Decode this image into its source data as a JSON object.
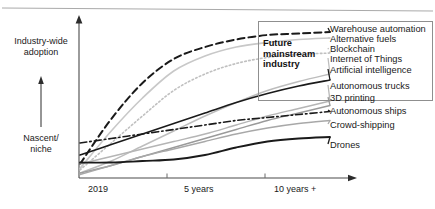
{
  "chart_data": {
    "type": "line",
    "title": "",
    "xlabel": "",
    "ylabel": "Industry-wide adoption / Nascent niche",
    "grid": false,
    "legend_position": "right",
    "x_tick_labels": [
      "2019",
      "5 years",
      "10 years +"
    ],
    "y_axis_low_label": "Nascent/\nniche",
    "y_axis_high_label": "Industry-wide\nadoption",
    "annotation": "Future\nmainstream\nindustry",
    "x": [
      0,
      0.5,
      1,
      1.5,
      2,
      2.5,
      3,
      3.5,
      4
    ],
    "xlim": [
      0,
      4
    ],
    "ylim": [
      0,
      100
    ],
    "series": [
      {
        "name": "Warehouse automation",
        "style": "dashed",
        "color": "#1a1a1a",
        "width": 2,
        "values": [
          8,
          38,
          62,
          78,
          86,
          91,
          94,
          95,
          96
        ]
      },
      {
        "name": "Alternative fuels",
        "style": "solid",
        "color": "#c8c8c8",
        "width": 1.6,
        "values": [
          5,
          30,
          52,
          70,
          80,
          86,
          89,
          91,
          92
        ]
      },
      {
        "name": "Blockchain",
        "style": "dotted",
        "color": "#c0c0c0",
        "width": 1.6,
        "values": [
          4,
          22,
          40,
          57,
          68,
          75,
          79,
          81,
          82
        ]
      },
      {
        "name": "Internet of Things",
        "style": "solid",
        "color": "#bdbdbd",
        "width": 1.4,
        "values": [
          2,
          10,
          20,
          30,
          40,
          49,
          57,
          63,
          68
        ]
      },
      {
        "name": "Artificial intelligence",
        "style": "solid",
        "color": "#1a1a1a",
        "width": 1.6,
        "values": [
          14,
          21,
          28,
          35,
          42,
          49,
          55,
          60,
          64
        ]
      },
      {
        "name": "Autonomous trucks",
        "style": "solid",
        "color": "#b5b5b5",
        "width": 1.4,
        "values": [
          8,
          13,
          18,
          23,
          28,
          34,
          40,
          45,
          50
        ]
      },
      {
        "name": "3D printing",
        "style": "solid",
        "color": "#9a9a9a",
        "width": 1.4,
        "values": [
          2,
          7,
          13,
          19,
          25,
          31,
          37,
          42,
          47
        ]
      },
      {
        "name": "Autonomous ships",
        "style": "dashdot",
        "color": "#1a1a1a",
        "width": 1.6,
        "values": [
          22,
          25,
          28,
          31,
          34,
          37,
          39,
          41,
          43
        ]
      },
      {
        "name": "Crowd-shipping",
        "style": "solid",
        "color": "#a8a8a8",
        "width": 1.4,
        "values": [
          1,
          7,
          13,
          18,
          23,
          28,
          32,
          35,
          37
        ]
      },
      {
        "name": "Drones",
        "style": "solid",
        "color": "#1a1a1a",
        "width": 1.8,
        "values": [
          9,
          9,
          10,
          11,
          14,
          19,
          23,
          25,
          26
        ]
      }
    ]
  },
  "legend": {
    "items": [
      {
        "label": "Warehouse automation"
      },
      {
        "label": "Alternative fuels"
      },
      {
        "label": "Blockchain"
      },
      {
        "label": "Internet of Things"
      },
      {
        "label": "Artificial intelligence"
      },
      {
        "label": "Autonomous trucks"
      },
      {
        "label": "3D printing"
      },
      {
        "label": "Autonomous ships"
      },
      {
        "label": "Crowd-shipping"
      },
      {
        "label": "Drones"
      }
    ]
  },
  "axes": {
    "y_high": "Industry-wide\nadoption",
    "y_low": "Nascent/\nniche",
    "x_ticks": [
      "2019",
      "5 years",
      "10 years +"
    ]
  },
  "annotation": {
    "text": "Future\nmainstream\nindustry"
  },
  "colors": {
    "ink": "#1a1a1a",
    "light": "#c0c0c0",
    "rule": "#aaaaaa"
  }
}
